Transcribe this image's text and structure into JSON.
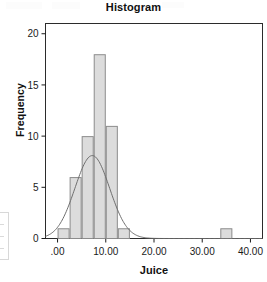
{
  "chart_data": {
    "type": "bar",
    "title": "Histogram",
    "xlabel": "Juice",
    "ylabel": "Frequency",
    "xlim": [
      -2.5,
      42.5
    ],
    "ylim": [
      0,
      21
    ],
    "grid": false,
    "legend": false,
    "bin_width": 2.5,
    "x_tick_values": [
      0,
      10,
      20,
      30,
      40
    ],
    "x_tick_labels": [
      ".00",
      "10.00",
      "20.00",
      "30.00",
      "40.00"
    ],
    "y_tick_values": [
      0,
      5,
      10,
      15,
      20
    ],
    "y_tick_labels": [
      "0",
      "5",
      "10",
      "15",
      "20"
    ],
    "bars": [
      {
        "bin_start": 0.0,
        "bin_end": 2.5,
        "center": 1.25,
        "value": 1
      },
      {
        "bin_start": 2.5,
        "bin_end": 5.0,
        "center": 3.75,
        "value": 6
      },
      {
        "bin_start": 5.0,
        "bin_end": 7.5,
        "center": 6.25,
        "value": 10
      },
      {
        "bin_start": 7.5,
        "bin_end": 10.0,
        "center": 8.75,
        "value": 18
      },
      {
        "bin_start": 10.0,
        "bin_end": 12.5,
        "center": 11.25,
        "value": 11
      },
      {
        "bin_start": 12.5,
        "bin_end": 15.0,
        "center": 13.75,
        "value": 1
      },
      {
        "bin_start": 33.75,
        "bin_end": 36.25,
        "center": 35.0,
        "value": 1
      }
    ],
    "categories": [
      "1.25",
      "3.75",
      "6.25",
      "8.75",
      "11.25",
      "13.75",
      "35.00"
    ],
    "values": [
      1,
      6,
      10,
      18,
      11,
      1,
      1
    ],
    "normal_curve": {
      "label": "Normal curve overlay",
      "peak_y": 8.1,
      "peak_x": 7.2,
      "sigma": 3.6
    },
    "colors": {
      "bar_fill": "#dcdcdc",
      "bar_stroke": "#8c8c8c",
      "axis": "#1a1a1a",
      "curve": "#6f6f6f",
      "text": "#111111",
      "background": "#ffffff"
    }
  },
  "figure": {
    "title": "Histogram",
    "x_axis_label": "Juice",
    "y_axis_label": "Frequency"
  }
}
